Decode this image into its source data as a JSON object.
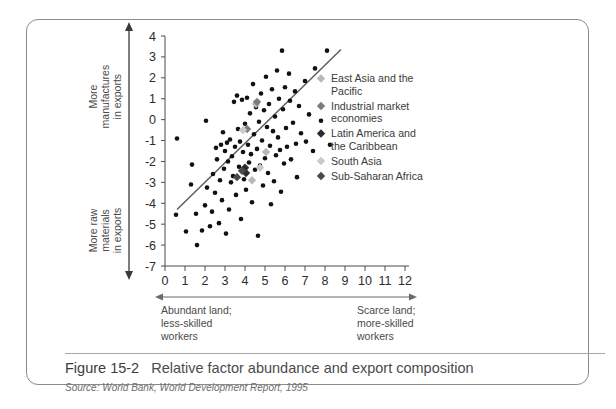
{
  "figure": {
    "number": "Figure 15-2",
    "title": "Relative factor abundance and export composition",
    "source_label": "Source:",
    "source_publisher": "World Bank,",
    "source_report": "World Development Report,",
    "source_year": "1995"
  },
  "axes": {
    "y": {
      "ticks": [
        "4",
        "3",
        "2",
        "1",
        "0",
        "-1",
        "-2",
        "-3",
        "-4",
        "-5",
        "-6",
        "-7"
      ],
      "tick_values": [
        4,
        3,
        2,
        1,
        0,
        -1,
        -2,
        -3,
        -4,
        -5,
        -6,
        -7
      ],
      "min": -7,
      "max": 4,
      "top_label_lines": [
        "More",
        "manufactures",
        "in exports"
      ],
      "bottom_label_lines": [
        "More raw",
        "materials",
        "in exports"
      ]
    },
    "x": {
      "ticks": [
        "0",
        "1",
        "2",
        "3",
        "4",
        "5",
        "6",
        "7",
        "8",
        "9",
        "10",
        "11",
        "12"
      ],
      "tick_values": [
        0,
        1,
        2,
        3,
        4,
        5,
        6,
        7,
        8,
        9,
        10,
        11,
        12
      ],
      "min": 0,
      "max": 12,
      "left_label_lines": [
        "Abundant land;",
        "less-skilled",
        "workers"
      ],
      "right_label_lines": [
        "Scarce land;",
        "more-skilled",
        "workers"
      ]
    }
  },
  "legend": {
    "items": [
      {
        "label_lines": [
          "East Asia and the",
          "Pacific"
        ],
        "color": "#b8b8b8",
        "name": "east-asia-and-the-pacific"
      },
      {
        "label_lines": [
          "Industrial market",
          "economies"
        ],
        "color": "#7d7d7d",
        "name": "industrial-market-economies"
      },
      {
        "label_lines": [
          "Latin America and",
          "the Caribbean"
        ],
        "color": "#2b2b2b",
        "name": "latin-america-and-the-caribbean"
      },
      {
        "label_lines": [
          "South Asia"
        ],
        "color": "#c9c9c9",
        "name": "south-asia"
      },
      {
        "label_lines": [
          "Sub-Saharan Africa"
        ],
        "color": "#4a4a4a",
        "name": "sub-saharan-africa"
      }
    ]
  },
  "chart_data": {
    "type": "scatter",
    "title": "Relative factor abundance and export composition",
    "xlabel": "Abundant land; less-skilled workers ↔ Scarce land; more-skilled workers",
    "ylabel": "More raw materials in exports ↔ More manufactures in exports",
    "xlim": [
      0,
      12
    ],
    "ylim": [
      -7,
      4
    ],
    "grid": false,
    "legend_position": "right",
    "trend_line": {
      "x1": 0.6,
      "y1": -4.3,
      "x2": 8.8,
      "y2": 3.35,
      "color": "#5a5a5a"
    },
    "series": [
      {
        "name": "Other economies",
        "marker": "circle",
        "color": "#111111",
        "points": [
          [
            0.55,
            -4.55
          ],
          [
            0.6,
            -0.9
          ],
          [
            1.05,
            -5.35
          ],
          [
            1.3,
            -3.1
          ],
          [
            1.35,
            -2.15
          ],
          [
            1.55,
            -4.5
          ],
          [
            1.6,
            -6.0
          ],
          [
            1.85,
            -5.3
          ],
          [
            2.0,
            -4.1
          ],
          [
            2.05,
            -0.05
          ],
          [
            2.1,
            -3.25
          ],
          [
            2.25,
            -5.1
          ],
          [
            2.35,
            -4.4
          ],
          [
            2.4,
            -2.6
          ],
          [
            2.5,
            -3.5
          ],
          [
            2.55,
            -1.35
          ],
          [
            2.6,
            -1.9
          ],
          [
            2.7,
            -4.95
          ],
          [
            2.75,
            -2.9
          ],
          [
            2.8,
            -1.2
          ],
          [
            2.85,
            -3.85
          ],
          [
            2.9,
            -0.6
          ],
          [
            2.95,
            -2.35
          ],
          [
            3.0,
            -1.5
          ],
          [
            3.05,
            -5.45
          ],
          [
            3.1,
            -1.1
          ],
          [
            3.15,
            -2.0
          ],
          [
            3.2,
            -4.3
          ],
          [
            3.25,
            -0.95
          ],
          [
            3.3,
            -3.0
          ],
          [
            3.35,
            -1.75
          ],
          [
            3.4,
            -2.7
          ],
          [
            3.45,
            0.85
          ],
          [
            3.5,
            -1.3
          ],
          [
            3.55,
            -3.6
          ],
          [
            3.6,
            1.15
          ],
          [
            3.65,
            -0.45
          ],
          [
            3.7,
            -2.25
          ],
          [
            3.75,
            -1.05
          ],
          [
            3.8,
            -4.75
          ],
          [
            3.85,
            0.95
          ],
          [
            3.9,
            -1.55
          ],
          [
            3.95,
            -2.85
          ],
          [
            4.0,
            -0.2
          ],
          [
            4.05,
            -3.35
          ],
          [
            4.1,
            1.05
          ],
          [
            4.15,
            -1.2
          ],
          [
            4.2,
            -2.05
          ],
          [
            4.25,
            0.3
          ],
          [
            4.3,
            -1.65
          ],
          [
            4.35,
            -3.95
          ],
          [
            4.4,
            1.7
          ],
          [
            4.45,
            -0.7
          ],
          [
            4.5,
            -2.4
          ],
          [
            4.55,
            0.6
          ],
          [
            4.6,
            -1.4
          ],
          [
            4.65,
            -5.55
          ],
          [
            4.7,
            -0.1
          ],
          [
            4.75,
            -2.2
          ],
          [
            4.8,
            1.25
          ],
          [
            4.85,
            -1.0
          ],
          [
            4.9,
            -3.15
          ],
          [
            4.95,
            0.45
          ],
          [
            5.0,
            -1.85
          ],
          [
            5.05,
            2.05
          ],
          [
            5.1,
            -0.35
          ],
          [
            5.15,
            -2.55
          ],
          [
            5.2,
            0.75
          ],
          [
            5.25,
            -1.25
          ],
          [
            5.3,
            -4.05
          ],
          [
            5.35,
            1.45
          ],
          [
            5.4,
            -0.55
          ],
          [
            5.45,
            -2.95
          ],
          [
            5.5,
            0.15
          ],
          [
            5.55,
            -1.7
          ],
          [
            5.6,
            2.35
          ],
          [
            5.65,
            -0.85
          ],
          [
            5.7,
            1.0
          ],
          [
            5.75,
            -1.45
          ],
          [
            5.8,
            -3.45
          ],
          [
            5.85,
            3.3
          ],
          [
            5.9,
            0.5
          ],
          [
            5.95,
            -2.1
          ],
          [
            6.0,
            1.55
          ],
          [
            6.05,
            -0.4
          ],
          [
            6.1,
            -1.3
          ],
          [
            6.2,
            2.2
          ],
          [
            6.25,
            0.9
          ],
          [
            6.3,
            -1.9
          ],
          [
            6.4,
            -0.15
          ],
          [
            6.5,
            1.35
          ],
          [
            6.55,
            -1.15
          ],
          [
            6.6,
            -2.75
          ],
          [
            6.7,
            0.65
          ],
          [
            6.8,
            -0.65
          ],
          [
            7.0,
            1.85
          ],
          [
            7.05,
            -1.05
          ],
          [
            7.2,
            0.25
          ],
          [
            7.4,
            -1.5
          ],
          [
            7.5,
            2.45
          ],
          [
            7.8,
            -0.05
          ],
          [
            8.1,
            3.3
          ],
          [
            8.25,
            -1.2
          ]
        ]
      },
      {
        "name": "East Asia and the Pacific",
        "marker": "diamond",
        "color": "#b8b8b8",
        "points": [
          [
            4.55,
            0.75
          ],
          [
            4.35,
            -2.9
          ],
          [
            5.05,
            -1.55
          ]
        ]
      },
      {
        "name": "Industrial market economies",
        "marker": "diamond",
        "color": "#7d7d7d",
        "points": [
          [
            4.6,
            0.85
          ],
          [
            4.1,
            -0.45
          ]
        ]
      },
      {
        "name": "Latin America and the Caribbean",
        "marker": "diamond",
        "color": "#2b2b2b",
        "points": [
          [
            4.0,
            -2.3
          ],
          [
            4.05,
            -2.55
          ]
        ]
      },
      {
        "name": "South Asia",
        "marker": "diamond",
        "color": "#c9c9c9",
        "points": [
          [
            3.9,
            -0.5
          ],
          [
            4.75,
            -2.3
          ]
        ]
      },
      {
        "name": "Sub-Saharan Africa",
        "marker": "diamond",
        "color": "#4a4a4a",
        "points": [
          [
            3.85,
            -2.45
          ],
          [
            3.6,
            -2.75
          ]
        ]
      }
    ]
  }
}
